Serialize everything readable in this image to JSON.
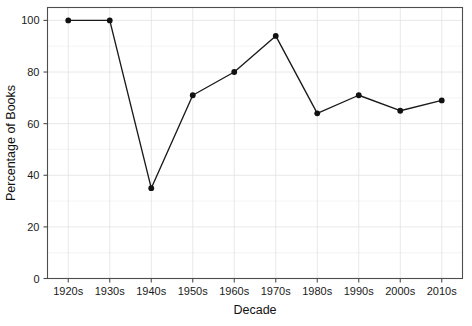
{
  "chart_data": {
    "type": "line",
    "title": "",
    "subtitle": "",
    "xlabel": "Decade",
    "ylabel": "Percentage of Books",
    "categories": [
      "1920s",
      "1930s",
      "1940s",
      "1950s",
      "1960s",
      "1970s",
      "1980s",
      "1990s",
      "2000s",
      "2010s"
    ],
    "values": [
      100,
      100,
      35,
      71,
      80,
      94,
      64,
      71,
      65,
      69
    ],
    "series": [
      {
        "name": "Percentage of Books",
        "values": [
          100,
          100,
          35,
          71,
          80,
          94,
          64,
          71,
          65,
          69
        ]
      }
    ],
    "ylim": [
      0,
      105
    ],
    "yticks": [
      0,
      20,
      40,
      60,
      80,
      100
    ],
    "ytick_labels": [
      "0",
      "20",
      "40",
      "60",
      "80",
      "100"
    ],
    "xtick_labels": [
      "1920s",
      "1930s",
      "1940s",
      "1950s",
      "1960s",
      "1970s",
      "1980s",
      "1990s",
      "2000s",
      "2010s"
    ],
    "grid": true,
    "grid_minor": true,
    "legend": false,
    "legend_position": "none",
    "marker": "circle",
    "line_color": "#1a1a1a",
    "marker_color": "#111111",
    "grid_color": "#e2e2e2",
    "frame_color": "#4d4d4d",
    "background_color": "#ffffff",
    "annotations": []
  }
}
